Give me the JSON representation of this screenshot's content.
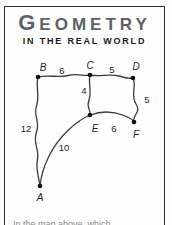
{
  "header": {
    "title_initial": "G",
    "title_rest": "EOMETRY",
    "subtitle": "IN THE REAL WORLD"
  },
  "figure": {
    "point_labels": {
      "A": "A",
      "B": "B",
      "C": "C",
      "D": "D",
      "E": "E",
      "F": "F"
    },
    "lengths": {
      "BC": "6",
      "CD": "5",
      "CE": "4",
      "DF": "5",
      "EF": "6",
      "AB": "12",
      "AE": "10"
    }
  },
  "footer": {
    "question_text": "In the map above, which"
  },
  "colors": {
    "title_gray": "#5c6166",
    "subtitle_black": "#1a1a1a",
    "line_ink": "#3b3b3b",
    "border": "#2f2f2f"
  }
}
